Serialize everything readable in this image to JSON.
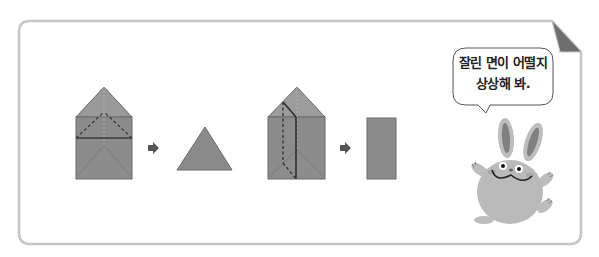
{
  "card": {
    "border_color": "#c6c6c6",
    "corner_fold_color": "#6e6e6e"
  },
  "diagram": {
    "steps": [
      {
        "solid": "triangular-prism-horizontal-cut",
        "cut_style": "dashed",
        "arrow": "right-arrow",
        "result_shape": "triangle"
      },
      {
        "solid": "triangular-prism-vertical-cut",
        "cut_style": "dashed",
        "arrow": "right-arrow",
        "result_shape": "rectangle"
      }
    ],
    "shape_fill": "#8a8a8a",
    "shape_fill_light": "#a2a2a2",
    "edge_color": "#5a5a5a",
    "cut_line_color": "#333333",
    "arrow_color": "#555555"
  },
  "speech_bubble": {
    "line1": "잘린 면이 어떨지",
    "line2": "상상해 봐."
  },
  "character": {
    "name": "rabbit",
    "body_color": "#b9b9b9",
    "inner_ear_color": "#808080"
  }
}
